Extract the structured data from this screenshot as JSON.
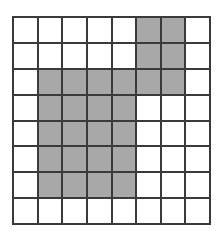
{
  "figure": {
    "name": "shaded-grid-figure",
    "rows": 8,
    "columns": 8,
    "colors": {
      "filled": "#a8a8a8",
      "empty": "#ffffff",
      "grid_line": "#3a3a3a",
      "background": "#ffffff"
    },
    "grid": [
      [
        0,
        0,
        0,
        0,
        0,
        1,
        1,
        0
      ],
      [
        0,
        0,
        0,
        0,
        0,
        1,
        1,
        0
      ],
      [
        0,
        1,
        1,
        1,
        1,
        1,
        1,
        0
      ],
      [
        0,
        1,
        1,
        1,
        1,
        0,
        0,
        0
      ],
      [
        0,
        1,
        1,
        1,
        1,
        0,
        0,
        0
      ],
      [
        0,
        1,
        1,
        1,
        1,
        0,
        0,
        0
      ],
      [
        0,
        1,
        1,
        1,
        1,
        0,
        0,
        0
      ],
      [
        0,
        0,
        0,
        0,
        0,
        0,
        0,
        0
      ]
    ]
  }
}
